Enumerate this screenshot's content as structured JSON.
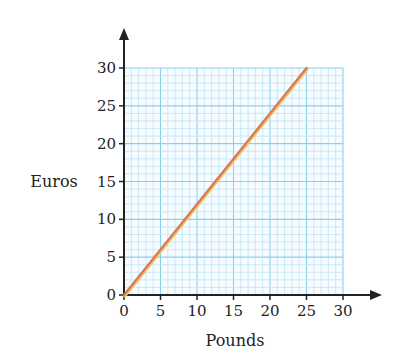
{
  "chart_data": {
    "type": "line",
    "title": "",
    "xlabel": "Pounds",
    "ylabel": "Euros",
    "xlim": [
      0,
      30
    ],
    "ylim": [
      0,
      30
    ],
    "x_ticks": [
      0,
      5,
      10,
      15,
      20,
      25,
      30
    ],
    "y_ticks": [
      0,
      5,
      10,
      15,
      20,
      25,
      30
    ],
    "x_tick_labels": [
      "0",
      "5",
      "10",
      "15",
      "20",
      "25",
      "30"
    ],
    "y_tick_labels": [
      "0",
      "5",
      "10",
      "15",
      "20",
      "25",
      "30"
    ],
    "grid": true,
    "grid_minor_step": 1,
    "grid_major_step": 5,
    "legend": null,
    "series": [
      {
        "name": "Pounds to Euros conversion",
        "x": [
          0,
          25
        ],
        "y": [
          0,
          30
        ],
        "color": "#d9785a"
      }
    ]
  },
  "colors": {
    "grid_minor": "#bfe3f5",
    "grid_major": "#8ecfee",
    "axis": "#222222",
    "line": "#d9785a",
    "line_highlight": "#f2c55a"
  }
}
